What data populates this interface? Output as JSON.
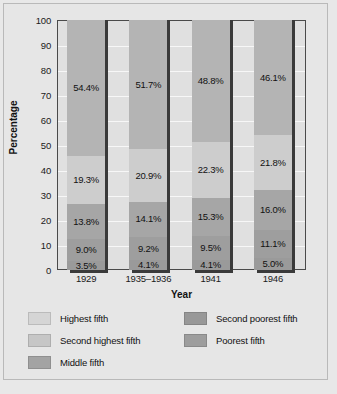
{
  "chart_data": {
    "type": "bar",
    "subtype": "stacked-bar-100",
    "title": "",
    "xlabel": "Year",
    "ylabel": "Percentage",
    "categories": [
      "1929",
      "1935–1936",
      "1941",
      "1946"
    ],
    "ylim": [
      0,
      100
    ],
    "yticks": [
      0,
      10,
      20,
      30,
      40,
      50,
      60,
      70,
      80,
      90,
      100
    ],
    "ytick_labels": [
      "0",
      "10",
      "20",
      "30",
      "40",
      "50",
      "60",
      "70",
      "80",
      "90",
      "100"
    ],
    "grid": true,
    "grid_axis": "y",
    "legend_position": "bottom",
    "legend_columns": 2,
    "stack_order_bottom_to_top": [
      "Poorest fifth",
      "Second poorest fifth",
      "Middle fifth",
      "Second highest fifth",
      "Highest fifth"
    ],
    "series": [
      {
        "name": "Poorest fifth",
        "color": "#9a9a9a",
        "values": [
          3.5,
          4.1,
          4.1,
          5.0
        ],
        "labels": [
          "3.5%",
          "4.1%",
          "4.1%",
          "5.0%"
        ]
      },
      {
        "name": "Second poorest fifth",
        "color": "#9e9e9e",
        "values": [
          9.0,
          9.2,
          9.5,
          11.1
        ],
        "labels": [
          "9.0%",
          "9.2%",
          "9.5%",
          "11.1%"
        ]
      },
      {
        "name": "Middle fifth",
        "color": "#a6a6a6",
        "values": [
          13.8,
          14.1,
          15.3,
          16.0
        ],
        "labels": [
          "13.8%",
          "14.1%",
          "15.3%",
          "16.0%"
        ]
      },
      {
        "name": "Second highest fifth",
        "color": "#cdcdcd",
        "values": [
          19.3,
          20.9,
          22.3,
          21.8
        ],
        "labels": [
          "19.3%",
          "20.9%",
          "22.3%",
          "21.8%"
        ]
      },
      {
        "name": "Highest fifth",
        "color": "#b4b4b4",
        "values": [
          54.4,
          51.7,
          48.8,
          46.1
        ],
        "labels": [
          "54.4%",
          "51.7%",
          "48.8%",
          "46.1%"
        ]
      }
    ],
    "legend": [
      {
        "label": "Highest fifth",
        "color": "#d5d5d5"
      },
      {
        "label": "Second highest fifth",
        "color": "#c6c6c6"
      },
      {
        "label": "Middle fifth",
        "color": "#a3a3a3"
      },
      {
        "label": "Second poorest fifth",
        "color": "#989898"
      },
      {
        "label": "Poorest fifth",
        "color": "#9d9d9d"
      }
    ],
    "colors": {
      "plot_background": "#e0e0e0",
      "figure_background": "#e6e6e6",
      "gridline": "#f7f7f7",
      "axis": "#4a4a4a",
      "bar_shadow": "#3a3a3a",
      "text": "#111111"
    }
  }
}
